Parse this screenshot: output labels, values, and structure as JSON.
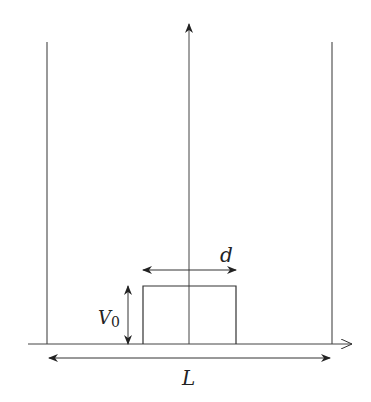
{
  "diagram": {
    "labels": {
      "barrier_width": "d",
      "barrier_height": "V",
      "barrier_height_subscript": "0",
      "well_width": "L"
    },
    "colors": {
      "line": "#333333",
      "background": "#ffffff"
    }
  }
}
